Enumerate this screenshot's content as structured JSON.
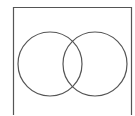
{
  "diagram": {
    "type": "venn",
    "universe": {
      "x": 13,
      "y": 7,
      "width": 118,
      "height": 115,
      "stroke": "#555555"
    },
    "sets": [
      {
        "name": "left-set",
        "cx": 50,
        "cy": 64,
        "r": 32,
        "stroke": "#555555"
      },
      {
        "name": "right-set",
        "cx": 95,
        "cy": 64,
        "r": 32,
        "stroke": "#555555"
      }
    ]
  }
}
